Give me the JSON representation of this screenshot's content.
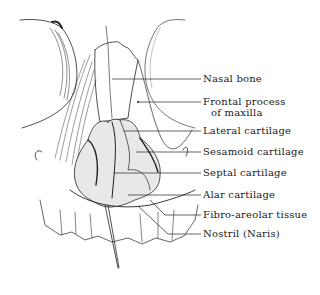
{
  "figure": {
    "labels": [
      {
        "id": "nasal-bone",
        "text": "Nasal bone"
      },
      {
        "id": "frontal-process",
        "text": "Frontal process",
        "text2": "of maxilla"
      },
      {
        "id": "lateral-cartilage",
        "text": "Lateral cartilage"
      },
      {
        "id": "sesamoid-cartilage",
        "text": "Sesamoid cartilage"
      },
      {
        "id": "septal-cartilage",
        "text": "Septal cartilage"
      },
      {
        "id": "alar-cartilage",
        "text": "Alar cartilage"
      },
      {
        "id": "fibro-areolar-tissue",
        "text": "Fibro-areolar tissue"
      },
      {
        "id": "nostril",
        "text": "Nostril (Naris)"
      }
    ]
  }
}
